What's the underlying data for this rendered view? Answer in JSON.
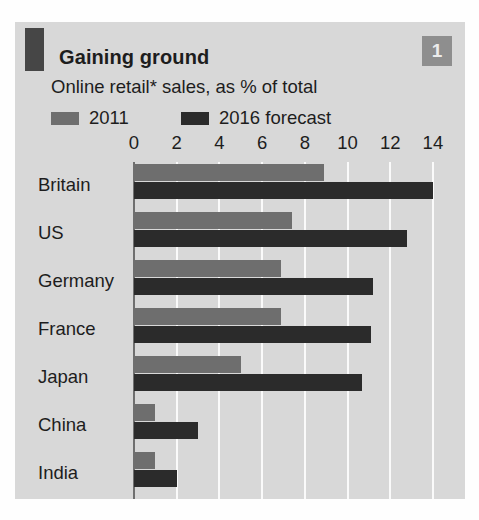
{
  "panel": {
    "badge_number": "1",
    "title": "Gaining ground",
    "subtitle": "Online retail* sales, as % of total",
    "colors": {
      "panel_background": "#d8d8d8",
      "corner_block": "#464646",
      "badge_background": "#8e8e8e",
      "series_2011": "#6e6e6e",
      "series_2016": "#2b2b2b",
      "gridline": "#fafafa",
      "axis_line": "#6f6f6f",
      "text": "#1d1d1d"
    }
  },
  "chart_data": {
    "type": "bar",
    "orientation": "horizontal",
    "title": "Gaining ground",
    "subtitle": "Online retail* sales, as % of total",
    "xlabel": "",
    "ylabel": "",
    "xlim": [
      0,
      14
    ],
    "xticks": [
      0,
      2,
      4,
      6,
      8,
      10,
      12,
      14
    ],
    "xtick_labels": [
      "0",
      "2",
      "4",
      "6",
      "8",
      "10",
      "12",
      "14"
    ],
    "grid": true,
    "legend_position": "top-left",
    "categories": [
      "Britain",
      "US",
      "Germany",
      "France",
      "Japan",
      "China",
      "India"
    ],
    "series": [
      {
        "name": "2011",
        "color": "#6e6e6e",
        "values": [
          8.9,
          7.4,
          6.9,
          6.9,
          5.0,
          1.0,
          1.0
        ]
      },
      {
        "name": "2016 forecast",
        "color": "#2b2b2b",
        "values": [
          14.0,
          12.8,
          11.2,
          11.1,
          10.7,
          3.0,
          2.0
        ]
      }
    ]
  }
}
